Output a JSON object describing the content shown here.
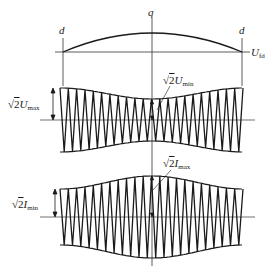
{
  "diagram": {
    "type": "waveform envelope diagram",
    "labels": {
      "q": "q",
      "d_left": "d",
      "d_right": "d",
      "u_fd": {
        "main": "U",
        "sub": "fd"
      },
      "sqrt2_umax": {
        "radical": "√",
        "coef": "2",
        "var": "U",
        "sub": "max"
      },
      "sqrt2_umin": {
        "radical": "√",
        "coef": "2",
        "var": "U",
        "sub": "min"
      },
      "sqrt2_imax": {
        "radical": "√",
        "coef": "2",
        "var": "I",
        "sub": "max"
      },
      "sqrt2_imin": {
        "radical": "√",
        "coef": "2",
        "var": "I",
        "sub": "min"
      }
    },
    "colors": {
      "stroke": "#1a1a1a",
      "thin": "#333333",
      "background": "#ffffff"
    },
    "top_curve": {
      "baseline_y": 52,
      "x_start": 63,
      "x_end": 242,
      "peak_x": 152,
      "peak_y": 33
    },
    "voltage_wave": {
      "center_y": 120,
      "x_start": 60,
      "x_end": 243,
      "edge_half_amplitude": 32,
      "center_half_amplitude": 21,
      "cycles": 22,
      "shape": "minimum at center (√2·Umin), maximum at edges (√2·Umax)"
    },
    "current_wave": {
      "center_y": 217,
      "x_start": 60,
      "x_end": 243,
      "edge_half_amplitude": 28,
      "center_half_amplitude": 41,
      "cycles": 22,
      "shape": "maximum at center (√2·Imax), minimum at edges (√2·Imin)"
    }
  }
}
